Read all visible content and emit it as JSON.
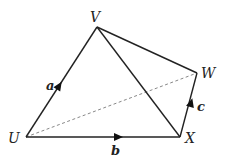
{
  "diagram": {
    "points": {
      "U": {
        "label": "U",
        "x": 26,
        "y": 137
      },
      "V": {
        "label": "V",
        "x": 97,
        "y": 27
      },
      "W": {
        "label": "W",
        "x": 197,
        "y": 73
      },
      "X": {
        "label": "X",
        "x": 180,
        "y": 137
      }
    },
    "vectors": {
      "a": {
        "label": "a",
        "from": "U",
        "to": "V"
      },
      "b": {
        "label": "b",
        "from": "U",
        "to": "X"
      },
      "c": {
        "label": "c",
        "from": "X",
        "to": "W"
      }
    },
    "segments": [
      {
        "from": "V",
        "to": "W",
        "style": "solid"
      },
      {
        "from": "V",
        "to": "X",
        "style": "solid"
      },
      {
        "from": "U",
        "to": "W",
        "style": "dashed"
      }
    ],
    "colors": {
      "line": "#222222",
      "dashed": "#777777"
    }
  }
}
